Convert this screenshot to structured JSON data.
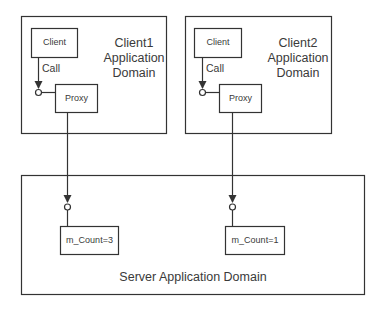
{
  "diagram": {
    "client1_domain": {
      "title_lines": [
        "Client1",
        "Application",
        "Domain"
      ],
      "client_label": "Client",
      "call_label": "Call",
      "proxy_label": "Proxy"
    },
    "client2_domain": {
      "title_lines": [
        "Client2",
        "Application",
        "Domain"
      ],
      "client_label": "Client",
      "call_label": "Call",
      "proxy_label": "Proxy"
    },
    "server_domain": {
      "title": "Server Application Domain",
      "objects": [
        {
          "label": "m_Count=3"
        },
        {
          "label": "m_Count=1"
        }
      ]
    },
    "colors": {
      "stroke": "#333333",
      "background": "#ffffff"
    }
  }
}
